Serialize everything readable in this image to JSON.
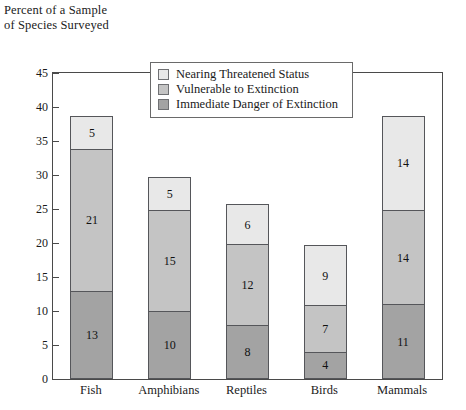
{
  "chart_data": {
    "type": "bar",
    "subtype": "stacked-bar",
    "title": "",
    "xlabel": "",
    "ylabel": "Percent of a Sample\nof Species Surveyed",
    "ylim": [
      0,
      45
    ],
    "yticks": [
      0,
      5,
      10,
      15,
      20,
      25,
      30,
      35,
      40,
      45
    ],
    "ytick_labels": [
      "0",
      "5",
      "10",
      "15",
      "20",
      "25",
      "30",
      "35",
      "40",
      "45"
    ],
    "grid": false,
    "legend_position": "upper center inside",
    "categories": [
      "Fish",
      "Amphibians",
      "Reptiles",
      "Birds",
      "Mammals"
    ],
    "series": [
      {
        "name": "Immediate Danger of Extinction",
        "color": "#a3a3a3",
        "values": [
          13,
          10,
          8,
          4,
          11
        ]
      },
      {
        "name": "Vulnerable to Extinction",
        "color": "#c4c4c4",
        "values": [
          21,
          15,
          12,
          7,
          14
        ]
      },
      {
        "name": "Nearing Threatened Status",
        "color": "#e8e8e8",
        "values": [
          5,
          5,
          6,
          9,
          14
        ]
      }
    ],
    "totals": [
      39,
      30,
      26,
      20,
      39
    ]
  },
  "axis": {
    "caption": "Percent of a Sample\nof Species Surveyed"
  },
  "legend": {
    "items": [
      {
        "label": "Nearing Threatened Status"
      },
      {
        "label": "Vulnerable to Extinction"
      },
      {
        "label": "Immediate Danger of Extinction"
      }
    ]
  }
}
